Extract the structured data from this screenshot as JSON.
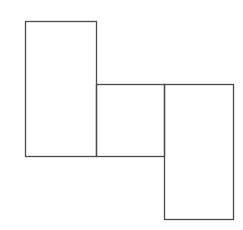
{
  "diagram": {
    "canvas": {
      "width": 243,
      "height": 230,
      "background": "#ffffff"
    },
    "stroke": {
      "color": "#4a4a4a",
      "width": 1.3
    },
    "shapes": [
      {
        "name": "left-rectangle",
        "x": 25,
        "y": 21,
        "width": 71,
        "height": 135
      },
      {
        "name": "middle-square",
        "x": 96,
        "y": 84,
        "width": 68,
        "height": 72
      },
      {
        "name": "right-rectangle",
        "x": 164,
        "y": 84,
        "width": 69,
        "height": 135
      }
    ]
  }
}
